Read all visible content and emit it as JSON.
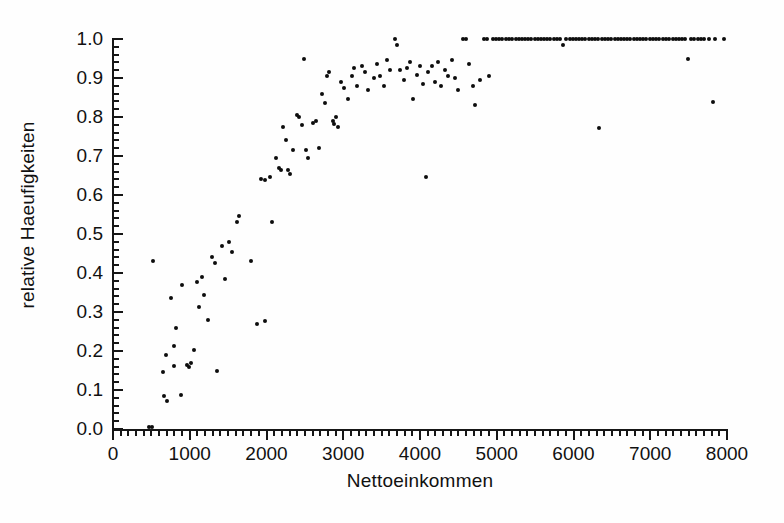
{
  "chart_data": {
    "type": "scatter",
    "title": "",
    "xlabel": "Nettoeinkommen",
    "ylabel": "relative Haeufigkeiten",
    "xlim": [
      0,
      8000
    ],
    "ylim": [
      0.0,
      1.0
    ],
    "grid": false,
    "legend": null,
    "marker": "filled-circle",
    "marker_color": "#0d0d0d",
    "x_ticks": [
      0,
      1000,
      2000,
      3000,
      4000,
      5000,
      6000,
      7000,
      8000
    ],
    "x_tick_labels": [
      "0",
      "1000",
      "2000",
      "3000",
      "4000",
      "5000",
      "6000",
      "7000",
      "8000"
    ],
    "x_minor_tick_step": 100,
    "y_ticks": [
      0.0,
      0.1,
      0.2,
      0.3,
      0.4,
      0.5,
      0.6,
      0.7,
      0.8,
      0.9,
      1.0
    ],
    "y_tick_labels": [
      "0.0",
      "0.1",
      "0.2",
      "0.3",
      "0.4",
      "0.5",
      "0.6",
      "0.7",
      "0.8",
      "0.9",
      "1.0"
    ],
    "y_minor_tick_step": 0.02,
    "points": [
      [
        470,
        0.005
      ],
      [
        505,
        0.005
      ],
      [
        520,
        0.43
      ],
      [
        650,
        0.145
      ],
      [
        660,
        0.085
      ],
      [
        690,
        0.19
      ],
      [
        705,
        0.073
      ],
      [
        760,
        0.335
      ],
      [
        790,
        0.162
      ],
      [
        800,
        0.212
      ],
      [
        815,
        0.26
      ],
      [
        880,
        0.088
      ],
      [
        905,
        0.37
      ],
      [
        960,
        0.165
      ],
      [
        985,
        0.16
      ],
      [
        1020,
        0.168
      ],
      [
        1060,
        0.202
      ],
      [
        1095,
        0.378
      ],
      [
        1120,
        0.313
      ],
      [
        1165,
        0.39
      ],
      [
        1190,
        0.343
      ],
      [
        1235,
        0.28
      ],
      [
        1290,
        0.44
      ],
      [
        1330,
        0.425
      ],
      [
        1360,
        0.148
      ],
      [
        1420,
        0.47
      ],
      [
        1455,
        0.385
      ],
      [
        1510,
        0.48
      ],
      [
        1555,
        0.455
      ],
      [
        1610,
        0.53
      ],
      [
        1645,
        0.545
      ],
      [
        1800,
        0.43
      ],
      [
        1870,
        0.268
      ],
      [
        1980,
        0.278
      ],
      [
        1930,
        0.64
      ],
      [
        1985,
        0.638
      ],
      [
        2040,
        0.645
      ],
      [
        2075,
        0.53
      ],
      [
        2130,
        0.695
      ],
      [
        2160,
        0.67
      ],
      [
        2185,
        0.665
      ],
      [
        2210,
        0.775
      ],
      [
        2255,
        0.74
      ],
      [
        2280,
        0.665
      ],
      [
        2305,
        0.655
      ],
      [
        2345,
        0.715
      ],
      [
        2400,
        0.805
      ],
      [
        2420,
        0.8
      ],
      [
        2460,
        0.78
      ],
      [
        2490,
        0.95
      ],
      [
        2520,
        0.715
      ],
      [
        2545,
        0.695
      ],
      [
        2610,
        0.785
      ],
      [
        2640,
        0.79
      ],
      [
        2690,
        0.72
      ],
      [
        2720,
        0.86
      ],
      [
        2760,
        0.835
      ],
      [
        2790,
        0.905
      ],
      [
        2810,
        0.915
      ],
      [
        2860,
        0.79
      ],
      [
        2880,
        0.782
      ],
      [
        2905,
        0.8
      ],
      [
        2930,
        0.775
      ],
      [
        2975,
        0.89
      ],
      [
        3010,
        0.875
      ],
      [
        3060,
        0.845
      ],
      [
        3110,
        0.905
      ],
      [
        3145,
        0.925
      ],
      [
        3185,
        0.88
      ],
      [
        3240,
        0.93
      ],
      [
        3280,
        0.915
      ],
      [
        3320,
        0.87
      ],
      [
        3400,
        0.9
      ],
      [
        3445,
        0.935
      ],
      [
        3480,
        0.905
      ],
      [
        3530,
        0.88
      ],
      [
        3570,
        0.945
      ],
      [
        3610,
        0.92
      ],
      [
        3680,
        1.0
      ],
      [
        3700,
        0.985
      ],
      [
        3745,
        0.92
      ],
      [
        3790,
        0.895
      ],
      [
        3830,
        0.925
      ],
      [
        3870,
        0.94
      ],
      [
        3910,
        0.845
      ],
      [
        3960,
        0.908
      ],
      [
        4000,
        0.93
      ],
      [
        4040,
        0.885
      ],
      [
        4075,
        0.645
      ],
      [
        4110,
        0.915
      ],
      [
        4160,
        0.93
      ],
      [
        4200,
        0.89
      ],
      [
        4240,
        0.94
      ],
      [
        4280,
        0.88
      ],
      [
        4320,
        0.92
      ],
      [
        4360,
        0.905
      ],
      [
        4420,
        0.945
      ],
      [
        4460,
        0.9
      ],
      [
        4500,
        0.87
      ],
      [
        4560,
        1.0
      ],
      [
        4600,
        1.0
      ],
      [
        4640,
        0.935
      ],
      [
        4690,
        0.88
      ],
      [
        4720,
        0.83
      ],
      [
        4780,
        0.895
      ],
      [
        4830,
        1.0
      ],
      [
        4870,
        1.0
      ],
      [
        4905,
        0.905
      ],
      [
        4950,
        1.0
      ],
      [
        4990,
        1.0
      ],
      [
        5030,
        1.0
      ],
      [
        5070,
        1.0
      ],
      [
        5120,
        1.0
      ],
      [
        5160,
        1.0
      ],
      [
        5200,
        1.0
      ],
      [
        5250,
        1.0
      ],
      [
        5290,
        1.0
      ],
      [
        5330,
        1.0
      ],
      [
        5370,
        1.0
      ],
      [
        5410,
        1.0
      ],
      [
        5450,
        1.0
      ],
      [
        5500,
        1.0
      ],
      [
        5540,
        1.0
      ],
      [
        5580,
        1.0
      ],
      [
        5620,
        1.0
      ],
      [
        5660,
        1.0
      ],
      [
        5700,
        1.0
      ],
      [
        5740,
        1.0
      ],
      [
        5790,
        1.0
      ],
      [
        5830,
        1.0
      ],
      [
        5860,
        0.985
      ],
      [
        5900,
        1.0
      ],
      [
        5950,
        1.0
      ],
      [
        5990,
        1.0
      ],
      [
        6030,
        1.0
      ],
      [
        6070,
        1.0
      ],
      [
        6110,
        1.0
      ],
      [
        6150,
        1.0
      ],
      [
        6200,
        1.0
      ],
      [
        6240,
        1.0
      ],
      [
        6280,
        1.0
      ],
      [
        6320,
        1.0
      ],
      [
        6330,
        0.772
      ],
      [
        6370,
        1.0
      ],
      [
        6410,
        1.0
      ],
      [
        6450,
        1.0
      ],
      [
        6490,
        1.0
      ],
      [
        6540,
        1.0
      ],
      [
        6580,
        1.0
      ],
      [
        6620,
        1.0
      ],
      [
        6660,
        1.0
      ],
      [
        6700,
        1.0
      ],
      [
        6740,
        1.0
      ],
      [
        6790,
        1.0
      ],
      [
        6830,
        1.0
      ],
      [
        6870,
        1.0
      ],
      [
        6910,
        1.0
      ],
      [
        6950,
        1.0
      ],
      [
        7000,
        1.0
      ],
      [
        7040,
        1.0
      ],
      [
        7080,
        1.0
      ],
      [
        7120,
        1.0
      ],
      [
        7160,
        1.0
      ],
      [
        7200,
        1.0
      ],
      [
        7250,
        1.0
      ],
      [
        7290,
        1.0
      ],
      [
        7330,
        1.0
      ],
      [
        7370,
        1.0
      ],
      [
        7410,
        1.0
      ],
      [
        7450,
        1.0
      ],
      [
        7490,
        0.95
      ],
      [
        7530,
        1.0
      ],
      [
        7570,
        1.0
      ],
      [
        7620,
        1.0
      ],
      [
        7660,
        1.0
      ],
      [
        7700,
        1.0
      ],
      [
        7760,
        1.0
      ],
      [
        7820,
        0.838
      ],
      [
        7850,
        1.0
      ],
      [
        7960,
        1.0
      ]
    ]
  },
  "axes": {
    "x_title": "Nettoeinkommen",
    "y_title": "relative Haeufigkeiten"
  }
}
